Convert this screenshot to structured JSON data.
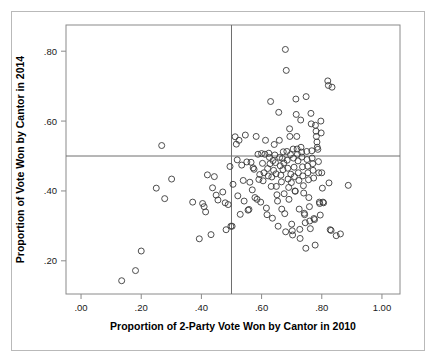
{
  "figure": {
    "border_color": "#b9b9b9",
    "background": "#ffffff"
  },
  "chart_data": {
    "type": "scatter",
    "title": "",
    "xlabel": "Proportion of 2-Party Vote Won by Cantor in 2010",
    "ylabel": "Proportion of Vote Won by Cantor in 2014",
    "xlim": [
      -0.05,
      1.06
    ],
    "ylim": [
      0.105,
      0.875
    ],
    "xticks": [
      0.0,
      0.2,
      0.4,
      0.6,
      0.8,
      1.0
    ],
    "xtick_labels": [
      ".00",
      ".20",
      ".40",
      ".60",
      ".80",
      "1.00"
    ],
    "yticks": [
      0.2,
      0.4,
      0.6,
      0.8
    ],
    "ytick_labels": [
      ".20",
      ".40",
      ".60",
      ".80"
    ],
    "grid": false,
    "legend": null,
    "marker": {
      "shape": "open-circle",
      "radius": 3.0,
      "stroke": "#3a3a3a",
      "stroke_width": 0.9,
      "fill": "none"
    },
    "reference_lines": [
      {
        "orientation": "horizontal",
        "value": 0.5,
        "color": "#6e6e6e"
      },
      {
        "orientation": "vertical",
        "value": 0.5,
        "color": "#6e6e6e"
      }
    ],
    "points": [
      [
        0.135,
        0.143
      ],
      [
        0.181,
        0.172
      ],
      [
        0.2,
        0.228
      ],
      [
        0.25,
        0.408
      ],
      [
        0.268,
        0.53
      ],
      [
        0.278,
        0.378
      ],
      [
        0.301,
        0.434
      ],
      [
        0.371,
        0.368
      ],
      [
        0.393,
        0.263
      ],
      [
        0.404,
        0.364
      ],
      [
        0.409,
        0.355
      ],
      [
        0.414,
        0.34
      ],
      [
        0.42,
        0.446
      ],
      [
        0.432,
        0.275
      ],
      [
        0.437,
        0.409
      ],
      [
        0.443,
        0.441
      ],
      [
        0.449,
        0.388
      ],
      [
        0.455,
        0.374
      ],
      [
        0.471,
        0.397
      ],
      [
        0.479,
        0.366
      ],
      [
        0.482,
        0.289
      ],
      [
        0.489,
        0.361
      ],
      [
        0.495,
        0.47
      ],
      [
        0.498,
        0.299
      ],
      [
        0.502,
        0.299
      ],
      [
        0.505,
        0.419
      ],
      [
        0.512,
        0.555
      ],
      [
        0.516,
        0.534
      ],
      [
        0.519,
        0.489
      ],
      [
        0.521,
        0.386
      ],
      [
        0.525,
        0.545
      ],
      [
        0.529,
        0.333
      ],
      [
        0.534,
        0.474
      ],
      [
        0.539,
        0.43
      ],
      [
        0.542,
        0.371
      ],
      [
        0.546,
        0.56
      ],
      [
        0.551,
        0.483
      ],
      [
        0.555,
        0.345
      ],
      [
        0.558,
        0.347
      ],
      [
        0.561,
        0.425
      ],
      [
        0.565,
        0.482
      ],
      [
        0.569,
        0.403
      ],
      [
        0.572,
        0.466
      ],
      [
        0.575,
        0.462
      ],
      [
        0.578,
        0.381
      ],
      [
        0.582,
        0.556
      ],
      [
        0.585,
        0.376
      ],
      [
        0.588,
        0.505
      ],
      [
        0.591,
        0.433
      ],
      [
        0.594,
        0.447
      ],
      [
        0.597,
        0.368
      ],
      [
        0.6,
        0.507
      ],
      [
        0.603,
        0.479
      ],
      [
        0.605,
        0.429
      ],
      [
        0.608,
        0.452
      ],
      [
        0.611,
        0.505
      ],
      [
        0.613,
        0.545
      ],
      [
        0.616,
        0.351
      ],
      [
        0.618,
        0.332
      ],
      [
        0.62,
        0.464
      ],
      [
        0.622,
        0.443
      ],
      [
        0.624,
        0.508
      ],
      [
        0.626,
        0.496
      ],
      [
        0.628,
        0.478
      ],
      [
        0.63,
        0.656
      ],
      [
        0.632,
        0.413
      ],
      [
        0.634,
        0.44
      ],
      [
        0.636,
        0.322
      ],
      [
        0.638,
        0.487
      ],
      [
        0.64,
        0.459
      ],
      [
        0.642,
        0.533
      ],
      [
        0.644,
        0.503
      ],
      [
        0.646,
        0.481
      ],
      [
        0.648,
        0.449
      ],
      [
        0.649,
        0.413
      ],
      [
        0.651,
        0.389
      ],
      [
        0.653,
        0.371
      ],
      [
        0.655,
        0.299
      ],
      [
        0.657,
        0.625
      ],
      [
        0.659,
        0.545
      ],
      [
        0.66,
        0.496
      ],
      [
        0.662,
        0.472
      ],
      [
        0.664,
        0.445
      ],
      [
        0.666,
        0.426
      ],
      [
        0.667,
        0.348
      ],
      [
        0.669,
        0.493
      ],
      [
        0.671,
        0.461
      ],
      [
        0.672,
        0.512
      ],
      [
        0.674,
        0.48
      ],
      [
        0.675,
        0.392
      ],
      [
        0.677,
        0.335
      ],
      [
        0.679,
        0.805
      ],
      [
        0.68,
        0.283
      ],
      [
        0.682,
        0.745
      ],
      [
        0.684,
        0.513
      ],
      [
        0.685,
        0.488
      ],
      [
        0.687,
        0.465
      ],
      [
        0.688,
        0.434
      ],
      [
        0.69,
        0.41
      ],
      [
        0.691,
        0.376
      ],
      [
        0.693,
        0.578
      ],
      [
        0.694,
        0.556
      ],
      [
        0.696,
        0.504
      ],
      [
        0.697,
        0.448
      ],
      [
        0.699,
        0.424
      ],
      [
        0.7,
        0.305
      ],
      [
        0.702,
        0.286
      ],
      [
        0.703,
        0.274
      ],
      [
        0.705,
        0.52
      ],
      [
        0.706,
        0.494
      ],
      [
        0.708,
        0.468
      ],
      [
        0.709,
        0.441
      ],
      [
        0.711,
        0.4
      ],
      [
        0.712,
        0.399
      ],
      [
        0.714,
        0.663
      ],
      [
        0.715,
        0.619
      ],
      [
        0.717,
        0.556
      ],
      [
        0.718,
        0.52
      ],
      [
        0.719,
        0.505
      ],
      [
        0.721,
        0.486
      ],
      [
        0.722,
        0.452
      ],
      [
        0.724,
        0.43
      ],
      [
        0.725,
        0.348
      ],
      [
        0.727,
        0.29
      ],
      [
        0.728,
        0.264
      ],
      [
        0.73,
        0.603
      ],
      [
        0.731,
        0.525
      ],
      [
        0.733,
        0.511
      ],
      [
        0.734,
        0.497
      ],
      [
        0.736,
        0.469
      ],
      [
        0.737,
        0.443
      ],
      [
        0.739,
        0.415
      ],
      [
        0.74,
        0.394
      ],
      [
        0.742,
        0.336
      ],
      [
        0.743,
        0.332
      ],
      [
        0.745,
        0.309
      ],
      [
        0.747,
        0.236
      ],
      [
        0.748,
        0.67
      ],
      [
        0.75,
        0.513
      ],
      [
        0.751,
        0.49
      ],
      [
        0.753,
        0.471
      ],
      [
        0.754,
        0.452
      ],
      [
        0.756,
        0.432
      ],
      [
        0.757,
        0.381
      ],
      [
        0.759,
        0.355
      ],
      [
        0.76,
        0.314
      ],
      [
        0.762,
        0.292
      ],
      [
        0.764,
        0.622
      ],
      [
        0.765,
        0.592
      ],
      [
        0.767,
        0.515
      ],
      [
        0.768,
        0.494
      ],
      [
        0.77,
        0.478
      ],
      [
        0.771,
        0.459
      ],
      [
        0.773,
        0.437
      ],
      [
        0.774,
        0.321
      ],
      [
        0.776,
        0.318
      ],
      [
        0.778,
        0.245
      ],
      [
        0.779,
        0.588
      ],
      [
        0.781,
        0.571
      ],
      [
        0.782,
        0.556
      ],
      [
        0.784,
        0.54
      ],
      [
        0.785,
        0.525
      ],
      [
        0.787,
        0.519
      ],
      [
        0.789,
        0.484
      ],
      [
        0.79,
        0.452
      ],
      [
        0.792,
        0.368
      ],
      [
        0.793,
        0.364
      ],
      [
        0.795,
        0.331
      ],
      [
        0.797,
        0.6
      ],
      [
        0.798,
        0.566
      ],
      [
        0.8,
        0.452
      ],
      [
        0.802,
        0.408
      ],
      [
        0.804,
        0.368
      ],
      [
        0.806,
        0.366
      ],
      [
        0.82,
        0.715
      ],
      [
        0.822,
        0.702
      ],
      [
        0.824,
        0.423
      ],
      [
        0.828,
        0.289
      ],
      [
        0.831,
        0.287
      ],
      [
        0.834,
        0.697
      ],
      [
        0.848,
        0.272
      ],
      [
        0.862,
        0.277
      ],
      [
        0.888,
        0.416
      ]
    ]
  }
}
